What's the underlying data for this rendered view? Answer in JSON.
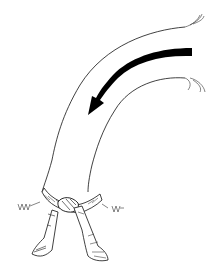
{
  "illustration": {
    "subject": "belt tied around a curved band with a directional arrow",
    "colors": {
      "background": "#ffffff",
      "ink": "#111111",
      "arrow": "#000000",
      "shade": "#555555"
    },
    "elements": [
      {
        "name": "curved-band-outer-edge",
        "type": "line"
      },
      {
        "name": "curved-band-inner-edge",
        "type": "line"
      },
      {
        "name": "direction-arrow",
        "type": "filled-arrow",
        "direction": "counter-clockwise-down"
      },
      {
        "name": "belt-knot",
        "type": "knot"
      },
      {
        "name": "belt-end-left",
        "type": "hanging-tail"
      },
      {
        "name": "belt-end-right",
        "type": "hanging-tail"
      }
    ]
  }
}
